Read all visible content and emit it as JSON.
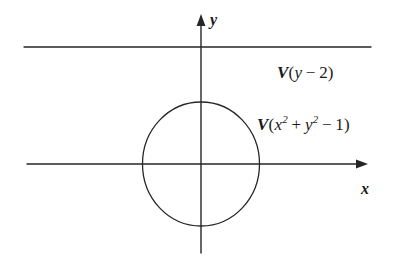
{
  "figure": {
    "background_color": "#ffffff",
    "stroke_color": "#262626",
    "width": 393,
    "height": 268,
    "axes": {
      "x_axis_label": "x",
      "y_axis_label": "y",
      "origin": {
        "x": 201,
        "y": 164
      },
      "x_axis": {
        "start_x": 27,
        "end_x": 368,
        "y": 164,
        "arrow": "right"
      },
      "y_axis": {
        "x": 201,
        "start_y": 17,
        "end_y": 253,
        "arrow": "up"
      }
    },
    "curves": [
      {
        "name": "horizontal-line",
        "label_v": "V",
        "label_body": "(y − 2)",
        "equation_plain": "V(y-2)",
        "y": 47,
        "start_x": 24,
        "end_x": 371
      },
      {
        "name": "unit-circle",
        "label_v": "V",
        "label_prefix": "(",
        "label_x": "x",
        "label_x_exp": "2",
        "label_plus": " + ",
        "label_y": "y",
        "label_y_exp": "2",
        "label_suffix": " − 1)",
        "equation_plain": "V(x^2+y^2-1)",
        "center_x": 201,
        "center_y": 164,
        "radius_x": 59,
        "radius_y": 62
      }
    ]
  }
}
